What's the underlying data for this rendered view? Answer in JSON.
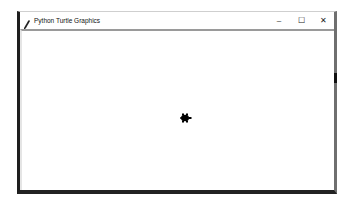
{
  "window": {
    "title": "Python Turtle Graphics",
    "controls": {
      "minimize": "–",
      "maximize": "☐",
      "close": "✕"
    }
  },
  "canvas": {
    "background": "#ffffff",
    "turtle": {
      "icon": "turtle-icon",
      "color": "#000000",
      "heading": "east"
    }
  }
}
